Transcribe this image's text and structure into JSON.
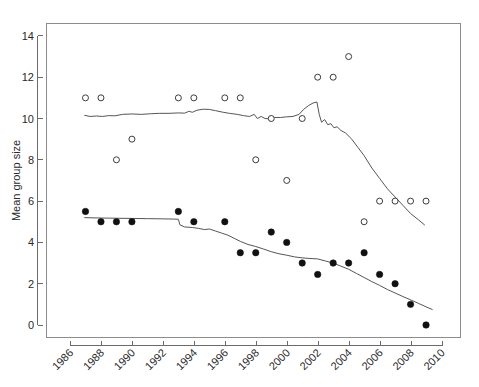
{
  "chart_data": {
    "type": "scatter",
    "title": "",
    "subtitle": "",
    "xlabel": "",
    "ylabel": "Mean group size",
    "xlim": [
      1985.3,
      2010.6
    ],
    "ylim": [
      -0.7,
      14.8
    ],
    "grid": false,
    "legend": "none",
    "x_ticks": [
      1986,
      1988,
      1990,
      1992,
      1994,
      1996,
      1998,
      2000,
      2002,
      2004,
      2006,
      2008,
      2010
    ],
    "x_tick_labels": [
      "1986",
      "1988",
      "1990",
      "1992",
      "1994",
      "1996",
      "1998",
      "2000",
      "2002",
      "2004",
      "2006",
      "2008",
      "2010"
    ],
    "x_tick_label_rotation_deg": -45,
    "y_ticks": [
      0,
      2,
      4,
      6,
      8,
      10,
      12,
      14
    ],
    "y_tick_labels": [
      "0",
      "2",
      "4",
      "6",
      "8",
      "10",
      "12",
      "14"
    ],
    "series": [
      {
        "name": "open-circles",
        "marker": "open-circle",
        "marker_color": "#3c3c3c",
        "points": [
          {
            "x": 1987,
            "y": 11
          },
          {
            "x": 1988,
            "y": 11
          },
          {
            "x": 1989,
            "y": 8
          },
          {
            "x": 1990,
            "y": 9
          },
          {
            "x": 1993,
            "y": 11
          },
          {
            "x": 1994,
            "y": 11
          },
          {
            "x": 1996,
            "y": 11
          },
          {
            "x": 1997,
            "y": 11
          },
          {
            "x": 1998,
            "y": 8
          },
          {
            "x": 1999,
            "y": 10
          },
          {
            "x": 2000,
            "y": 7
          },
          {
            "x": 2001,
            "y": 10
          },
          {
            "x": 2002,
            "y": 12
          },
          {
            "x": 2003,
            "y": 12
          },
          {
            "x": 2004,
            "y": 13
          },
          {
            "x": 2005,
            "y": 5
          },
          {
            "x": 2006,
            "y": 6
          },
          {
            "x": 2007,
            "y": 6
          },
          {
            "x": 2008,
            "y": 6
          },
          {
            "x": 2009,
            "y": 6
          }
        ]
      },
      {
        "name": "filled-circles",
        "marker": "filled-circle",
        "marker_color": "#111111",
        "points": [
          {
            "x": 1987,
            "y": 5.5
          },
          {
            "x": 1988,
            "y": 5.0
          },
          {
            "x": 1989,
            "y": 5.0
          },
          {
            "x": 1990,
            "y": 5.0
          },
          {
            "x": 1993,
            "y": 5.5
          },
          {
            "x": 1994,
            "y": 5.0
          },
          {
            "x": 1996,
            "y": 5.0
          },
          {
            "x": 1997,
            "y": 3.5
          },
          {
            "x": 1998,
            "y": 3.5
          },
          {
            "x": 1999,
            "y": 4.5
          },
          {
            "x": 2000,
            "y": 4.0
          },
          {
            "x": 2001,
            "y": 3.0
          },
          {
            "x": 2002,
            "y": 2.45
          },
          {
            "x": 2003,
            "y": 3.0
          },
          {
            "x": 2004,
            "y": 3.0
          },
          {
            "x": 2005,
            "y": 3.5
          },
          {
            "x": 2006,
            "y": 2.45
          },
          {
            "x": 2007,
            "y": 2.0
          },
          {
            "x": 2008,
            "y": 1.0
          },
          {
            "x": 2009,
            "y": 0.0
          }
        ]
      }
    ],
    "lines": [
      {
        "name": "upper-trend-line",
        "color": "#555555",
        "points": [
          [
            1986.95,
            10.15
          ],
          [
            1987.3,
            10.1
          ],
          [
            1987.7,
            10.12
          ],
          [
            1988.1,
            10.1
          ],
          [
            1988.5,
            10.14
          ],
          [
            1988.9,
            10.13
          ],
          [
            1989.4,
            10.2
          ],
          [
            1990.0,
            10.22
          ],
          [
            1990.6,
            10.2
          ],
          [
            1991.2,
            10.23
          ],
          [
            1991.8,
            10.25
          ],
          [
            1992.4,
            10.25
          ],
          [
            1993.0,
            10.27
          ],
          [
            1993.4,
            10.26
          ],
          [
            1993.7,
            10.35
          ],
          [
            1993.9,
            10.3
          ],
          [
            1994.2,
            10.4
          ],
          [
            1994.6,
            10.45
          ],
          [
            1995.0,
            10.44
          ],
          [
            1995.4,
            10.38
          ],
          [
            1995.9,
            10.3
          ],
          [
            1996.3,
            10.25
          ],
          [
            1996.8,
            10.2
          ],
          [
            1997.2,
            10.14
          ],
          [
            1997.6,
            10.1
          ],
          [
            1997.9,
            10.2
          ],
          [
            1998.1,
            10.0
          ],
          [
            1998.35,
            10.1
          ],
          [
            1998.6,
            10.0
          ],
          [
            1998.9,
            9.98
          ],
          [
            1999.2,
            10.05
          ],
          [
            1999.6,
            10.05
          ],
          [
            2000.0,
            10.08
          ],
          [
            2000.4,
            10.1
          ],
          [
            2000.8,
            10.2
          ],
          [
            2001.1,
            10.45
          ],
          [
            2001.4,
            10.62
          ],
          [
            2001.7,
            10.75
          ],
          [
            2001.95,
            10.8
          ],
          [
            2002.1,
            10.2
          ],
          [
            2002.25,
            9.82
          ],
          [
            2002.45,
            9.95
          ],
          [
            2002.65,
            9.7
          ],
          [
            2002.85,
            9.75
          ],
          [
            2003.05,
            9.55
          ],
          [
            2003.25,
            9.6
          ],
          [
            2003.5,
            9.42
          ],
          [
            2003.8,
            9.3
          ],
          [
            2004.2,
            9.0
          ],
          [
            2004.6,
            8.6
          ],
          [
            2005.0,
            8.2
          ],
          [
            2005.5,
            7.6
          ],
          [
            2006.0,
            7.1
          ],
          [
            2006.5,
            6.6
          ],
          [
            2007.0,
            6.2
          ],
          [
            2007.5,
            5.8
          ],
          [
            2008.0,
            5.4
          ],
          [
            2008.5,
            5.1
          ],
          [
            2008.9,
            4.85
          ]
        ]
      },
      {
        "name": "lower-trend-line",
        "color": "#555555",
        "points": [
          [
            1986.95,
            5.2
          ],
          [
            1988.0,
            5.18
          ],
          [
            1989.0,
            5.17
          ],
          [
            1990.0,
            5.16
          ],
          [
            1991.0,
            5.15
          ],
          [
            1992.0,
            5.14
          ],
          [
            1992.7,
            5.13
          ],
          [
            1993.0,
            5.12
          ],
          [
            1993.1,
            4.85
          ],
          [
            1993.4,
            4.75
          ],
          [
            1993.9,
            4.72
          ],
          [
            1994.3,
            4.68
          ],
          [
            1994.7,
            4.62
          ],
          [
            1995.0,
            4.65
          ],
          [
            1995.4,
            4.55
          ],
          [
            1995.8,
            4.45
          ],
          [
            1996.2,
            4.35
          ],
          [
            1996.6,
            4.2
          ],
          [
            1997.0,
            4.05
          ],
          [
            1997.5,
            3.9
          ],
          [
            1998.0,
            3.8
          ],
          [
            1998.5,
            3.68
          ],
          [
            1999.0,
            3.55
          ],
          [
            1999.5,
            3.45
          ],
          [
            2000.0,
            3.38
          ],
          [
            2000.5,
            3.3
          ],
          [
            2001.0,
            3.25
          ],
          [
            2001.5,
            3.22
          ],
          [
            2002.0,
            3.2
          ],
          [
            2002.5,
            3.1
          ],
          [
            2003.0,
            3.0
          ],
          [
            2003.5,
            2.85
          ],
          [
            2004.0,
            2.7
          ],
          [
            2004.5,
            2.5
          ],
          [
            2005.0,
            2.3
          ],
          [
            2005.5,
            2.1
          ],
          [
            2006.0,
            1.92
          ],
          [
            2006.5,
            1.72
          ],
          [
            2007.0,
            1.55
          ],
          [
            2007.5,
            1.38
          ],
          [
            2008.0,
            1.22
          ],
          [
            2008.5,
            1.05
          ],
          [
            2009.0,
            0.88
          ],
          [
            2009.4,
            0.75
          ]
        ]
      }
    ]
  }
}
